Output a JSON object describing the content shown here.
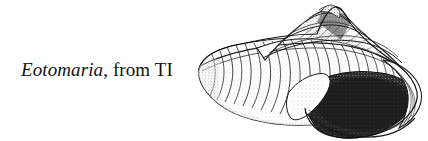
{
  "figure": {
    "background_color": "#ffffff",
    "ink_color": "#1a1a1a",
    "caption": {
      "genus": "Eotomaria",
      "rest": ", from TI",
      "full_text": "Eotomaria, from TI"
    },
    "illustration": {
      "subject": "fossil gastropod shell",
      "genus": "Eotomaria",
      "style": "pen-and-ink stipple line drawing",
      "orientation": "apex upper right, aperture lower right",
      "features": [
        "conical spire with whorls",
        "selenizone slit band",
        "curved axial growth lines on body whorl",
        "dark stippled aperture",
        "outer lip margin"
      ],
      "shell_fill": "#ffffff",
      "aperture_fill": "#2a2a2a"
    }
  }
}
